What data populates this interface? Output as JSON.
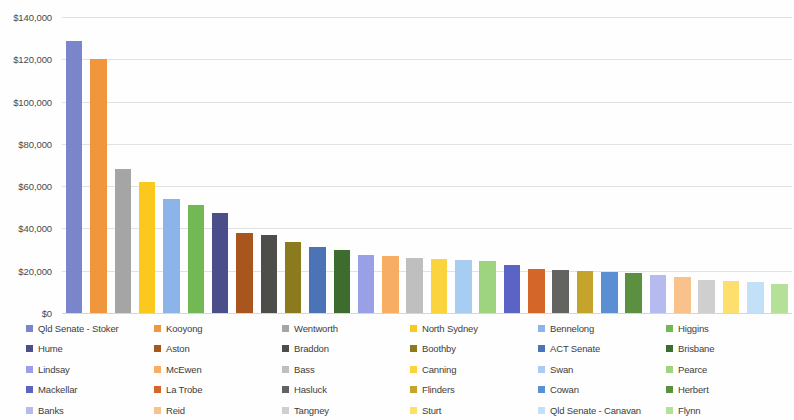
{
  "chart_data": {
    "type": "bar",
    "title": "",
    "subtitle": "",
    "xlabel": "",
    "ylabel": "",
    "ylim": [
      0,
      140000
    ],
    "y_ticks": [
      0,
      20000,
      40000,
      60000,
      80000,
      100000,
      120000,
      140000
    ],
    "y_tick_labels": [
      "$0",
      "$20,000",
      "$40,000",
      "$60,000",
      "$80,000",
      "$100,000",
      "$120,000",
      "$140,000"
    ],
    "grid": true,
    "legend_position": "bottom",
    "legend_columns": 6,
    "currency_prefix": "$",
    "categories": [
      "Qld Senate - Stoker",
      "Kooyong",
      "Wentworth",
      "North Sydney",
      "Bennelong",
      "Higgins",
      "Hume",
      "Aston",
      "Braddon",
      "Boothby",
      "ACT Senate",
      "Brisbane",
      "Lindsay",
      "McEwen",
      "Bass",
      "Canning",
      "Swan",
      "Pearce",
      "Mackellar",
      "La Trobe",
      "Hasluck",
      "Flinders",
      "Cowan",
      "Herbert",
      "Banks",
      "Reid",
      "Tangney",
      "Sturt",
      "Qld Senate - Canavan",
      "Flynn"
    ],
    "values": [
      128500,
      120000,
      68000,
      62000,
      54000,
      51000,
      47500,
      38000,
      37000,
      33500,
      31000,
      30000,
      27500,
      27000,
      26000,
      25500,
      25000,
      24500,
      22500,
      21000,
      20500,
      20000,
      19500,
      19000,
      18000,
      17000,
      15500,
      15000,
      14500,
      13500
    ],
    "colors": [
      "#7b85cc",
      "#f0963c",
      "#a5a5a5",
      "#fbc81f",
      "#8cb4e8",
      "#72b855",
      "#4a4f8a",
      "#a9561e",
      "#4d4d49",
      "#8c7a1e",
      "#4b73b5",
      "#3e6b2e",
      "#9aa0e6",
      "#f7ad63",
      "#bfbfbf",
      "#fbd33f",
      "#a7cdf2",
      "#9ed47f",
      "#5b64c4",
      "#d4662a",
      "#63635f",
      "#c4a42a",
      "#5b8fd4",
      "#5b9040",
      "#b5bbee",
      "#f9c28c",
      "#cfcfcf",
      "#fcdf6c",
      "#c2e0f8",
      "#b5e097"
    ]
  },
  "legend": {
    "items": [
      {
        "label": "Qld Senate - Stoker",
        "color": "#7b85cc"
      },
      {
        "label": "Kooyong",
        "color": "#f0963c"
      },
      {
        "label": "Wentworth",
        "color": "#a5a5a5"
      },
      {
        "label": "North Sydney",
        "color": "#fbc81f"
      },
      {
        "label": "Bennelong",
        "color": "#8cb4e8"
      },
      {
        "label": "Higgins",
        "color": "#72b855"
      },
      {
        "label": "Hume",
        "color": "#4a4f8a"
      },
      {
        "label": "Aston",
        "color": "#a9561e"
      },
      {
        "label": "Braddon",
        "color": "#4d4d49"
      },
      {
        "label": "Boothby",
        "color": "#8c7a1e"
      },
      {
        "label": "ACT Senate",
        "color": "#4b73b5"
      },
      {
        "label": "Brisbane",
        "color": "#3e6b2e"
      },
      {
        "label": "Lindsay",
        "color": "#9aa0e6"
      },
      {
        "label": "McEwen",
        "color": "#f7ad63"
      },
      {
        "label": "Bass",
        "color": "#bfbfbf"
      },
      {
        "label": "Canning",
        "color": "#fbd33f"
      },
      {
        "label": "Swan",
        "color": "#a7cdf2"
      },
      {
        "label": "Pearce",
        "color": "#9ed47f"
      },
      {
        "label": "Mackellar",
        "color": "#5b64c4"
      },
      {
        "label": "La Trobe",
        "color": "#d4662a"
      },
      {
        "label": "Hasluck",
        "color": "#63635f"
      },
      {
        "label": "Flinders",
        "color": "#c4a42a"
      },
      {
        "label": "Cowan",
        "color": "#5b8fd4"
      },
      {
        "label": "Herbert",
        "color": "#5b9040"
      },
      {
        "label": "Banks",
        "color": "#b5bbee"
      },
      {
        "label": "Reid",
        "color": "#f9c28c"
      },
      {
        "label": "Tangney",
        "color": "#cfcfcf"
      },
      {
        "label": "Sturt",
        "color": "#fcdf6c"
      },
      {
        "label": "Qld Senate - Canavan",
        "color": "#c2e0f8"
      },
      {
        "label": "Flynn",
        "color": "#b5e097"
      }
    ]
  }
}
